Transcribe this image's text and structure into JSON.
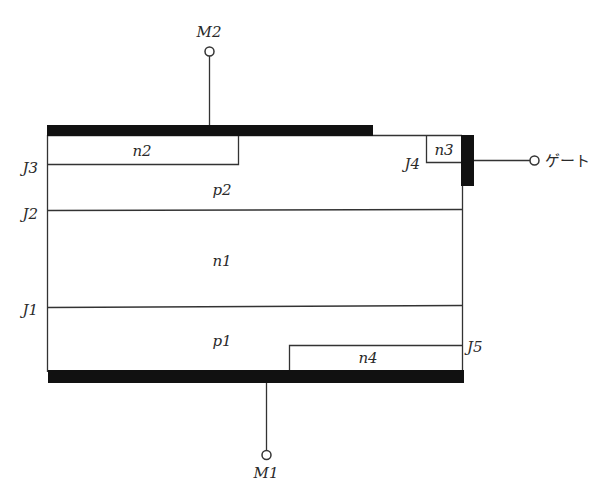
{
  "diagram": {
    "title": "",
    "terminals": {
      "top": "M2",
      "bottom": "M1",
      "gate": "ゲート"
    },
    "regions": {
      "n2": "n2",
      "n3": "n3",
      "p2": "p2",
      "n1": "n1",
      "p1": "p1",
      "n4": "n4"
    },
    "junctions": {
      "j1": "J1",
      "j2": "J2",
      "j3": "J3",
      "j4": "J4",
      "j5": "J5"
    },
    "colors": {
      "electrode": "#111111",
      "line": "#333333"
    }
  }
}
